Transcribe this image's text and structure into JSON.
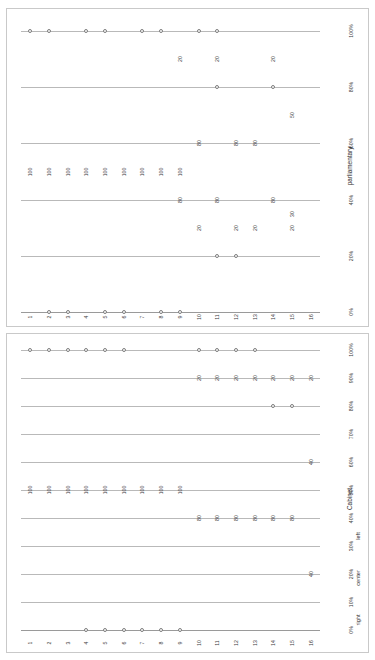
{
  "figure": {
    "panels": [
      "parliamentary",
      "Cabinet"
    ],
    "marker_color": "#7d7d7d",
    "grid_color": "#b9b9b9",
    "text_color": "#3b3b3b"
  },
  "chart_data": [
    {
      "type": "scatter",
      "title": "parliamentary",
      "xlabel": "",
      "ylabel": "",
      "grid": true,
      "legend_position": "right",
      "legend": [],
      "categories": [
        "1",
        "2",
        "3",
        "4",
        "5",
        "6",
        "7",
        "8",
        "9",
        "10",
        "11",
        "12",
        "13",
        "14",
        "15",
        "16"
      ],
      "value_ticks": [
        "0%",
        "20%",
        "40%",
        "60%",
        "80%",
        "100%"
      ],
      "ylim": [
        0,
        100
      ],
      "series": [
        {
          "name": "left",
          "points": [
            {
              "category": "1",
              "value": 100,
              "label": "100"
            },
            {
              "category": "2",
              "value": 100,
              "label": "100"
            },
            {
              "category": "3",
              "value": 100,
              "label": "100"
            },
            {
              "category": "4",
              "value": 100,
              "label": "100"
            },
            {
              "category": "5",
              "value": 100,
              "label": "100"
            },
            {
              "category": "6",
              "value": 100,
              "label": "100"
            },
            {
              "category": "7",
              "value": 100,
              "label": "100"
            },
            {
              "category": "8",
              "value": 100,
              "label": "100"
            },
            {
              "category": "9",
              "value": 100,
              "label": "100"
            },
            {
              "category": "10",
              "value": 80,
              "label": "80"
            },
            {
              "category": "11",
              "value": 80,
              "label": "80"
            },
            {
              "category": "13",
              "value": 80,
              "label": "80"
            },
            {
              "category": "14",
              "value": 50,
              "label": "50"
            },
            {
              "category": "16",
              "value": 30,
              "label": "30"
            }
          ]
        },
        {
          "name": "center",
          "points": [
            {
              "category": "10",
              "value": 20,
              "label": "20"
            },
            {
              "category": "12",
              "value": 20,
              "label": "20"
            },
            {
              "category": "13",
              "value": 20,
              "label": "20"
            },
            {
              "category": "15",
              "value": 20,
              "label": "20"
            },
            {
              "category": "11",
              "value": 20,
              "label": "20"
            },
            {
              "category": "14",
              "value": 20,
              "label": "20"
            },
            {
              "category": "16",
              "value": 20,
              "label": "20"
            }
          ]
        }
      ],
      "markers_100pct": [
        "1",
        "2",
        "4",
        "5",
        "7",
        "8",
        "10",
        "11"
      ],
      "markers_80pct": [
        "11",
        "14"
      ],
      "markers_20pct": [
        "11",
        "12"
      ],
      "markers_0pct": [
        "2",
        "3",
        "5",
        "6",
        "8",
        "9"
      ],
      "labels_60pct": [
        {
          "category": "10",
          "label": "80"
        },
        {
          "category": "12",
          "label": "80"
        },
        {
          "category": "13",
          "label": "80"
        }
      ],
      "labels_40pct": [
        {
          "category": "9",
          "label": "80"
        },
        {
          "category": "11",
          "label": "80"
        },
        {
          "category": "14",
          "label": "80"
        }
      ],
      "labels_50pct": [
        {
          "category": "1",
          "label": "100"
        },
        {
          "category": "2",
          "label": "100"
        },
        {
          "category": "3",
          "label": "100"
        },
        {
          "category": "4",
          "label": "100"
        },
        {
          "category": "5",
          "label": "100"
        },
        {
          "category": "6",
          "label": "100"
        },
        {
          "category": "7",
          "label": "100"
        },
        {
          "category": "8",
          "label": "100"
        },
        {
          "category": "9",
          "label": "100"
        }
      ],
      "labels_90pct": [
        {
          "category": "9",
          "label": "20"
        },
        {
          "category": "11",
          "label": "20"
        },
        {
          "category": "14",
          "label": "20"
        }
      ],
      "labels_30pct": [
        {
          "category": "10",
          "label": "20"
        },
        {
          "category": "12",
          "label": "20"
        },
        {
          "category": "13",
          "label": "20"
        },
        {
          "category": "15",
          "label": "20"
        }
      ],
      "labels_70pct": [
        {
          "category": "15",
          "label": "50"
        }
      ],
      "labels_35pct": [
        {
          "category": "15",
          "label": "30"
        }
      ]
    },
    {
      "type": "scatter",
      "title": "Cabinet",
      "xlabel": "",
      "ylabel": "",
      "grid": true,
      "legend_position": "right",
      "legend": [
        "left",
        "center",
        "right"
      ],
      "categories": [
        "1",
        "2",
        "3",
        "4",
        "5",
        "6",
        "7",
        "8",
        "9",
        "10",
        "11",
        "12",
        "13",
        "14",
        "15",
        "16"
      ],
      "value_ticks": [
        "0%",
        "10%",
        "20%",
        "30%",
        "40%",
        "50%",
        "60%",
        "70%",
        "80%",
        "90%",
        "100%"
      ],
      "ylim": [
        0,
        100
      ],
      "markers_100pct": [
        "1",
        "2",
        "3",
        "4",
        "5",
        "6",
        "10",
        "11",
        "12",
        "13"
      ],
      "markers_80pct": [
        "14",
        "15"
      ],
      "markers_0pct": [
        "4",
        "5",
        "6",
        "7",
        "8",
        "9"
      ],
      "labels_90pct": [
        {
          "category": "10",
          "label": "20"
        },
        {
          "category": "11",
          "label": "20"
        },
        {
          "category": "12",
          "label": "20"
        },
        {
          "category": "13",
          "label": "20"
        },
        {
          "category": "14",
          "label": "20"
        },
        {
          "category": "15",
          "label": "20"
        },
        {
          "category": "16",
          "label": "20"
        }
      ],
      "labels_60pct": [
        {
          "category": "16",
          "label": "40"
        }
      ],
      "labels_50pct": [
        {
          "category": "1",
          "label": "100"
        },
        {
          "category": "2",
          "label": "100"
        },
        {
          "category": "3",
          "label": "100"
        },
        {
          "category": "4",
          "label": "100"
        },
        {
          "category": "5",
          "label": "100"
        },
        {
          "category": "6",
          "label": "100"
        },
        {
          "category": "7",
          "label": "100"
        },
        {
          "category": "8",
          "label": "100"
        },
        {
          "category": "9",
          "label": "100"
        }
      ],
      "labels_40pct": [
        {
          "category": "10",
          "label": "80"
        },
        {
          "category": "11",
          "label": "80"
        },
        {
          "category": "12",
          "label": "80"
        },
        {
          "category": "13",
          "label": "80"
        },
        {
          "category": "14",
          "label": "80"
        },
        {
          "category": "15",
          "label": "80"
        }
      ],
      "labels_20pct": [
        {
          "category": "16",
          "label": "40"
        }
      ]
    }
  ]
}
